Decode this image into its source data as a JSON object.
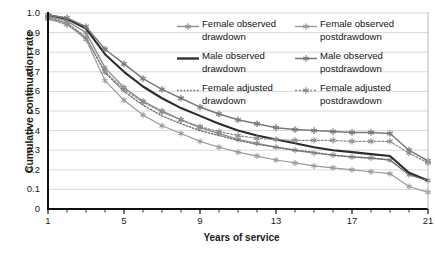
{
  "chart_data": {
    "type": "line",
    "title": "",
    "xlabel": "Years of service",
    "ylabel": "Cumulative continuation rate",
    "xlim": [
      1,
      21
    ],
    "ylim": [
      0,
      1.0
    ],
    "grid": true,
    "legend_position": "top-right",
    "x": [
      1,
      2,
      3,
      4,
      5,
      6,
      7,
      8,
      9,
      10,
      11,
      12,
      13,
      14,
      15,
      16,
      17,
      18,
      19,
      20,
      21
    ],
    "yticks": [
      "0",
      "0.1",
      "0.2",
      "0.3",
      "0.4",
      "0.5",
      "0.6",
      "0.7",
      "0.8",
      "0.9",
      "1.0"
    ],
    "xticks": [
      "1",
      "5",
      "9",
      "13",
      "17",
      "21"
    ],
    "series": [
      {
        "name": "Female observed drawdown",
        "color": "#8f8f8f",
        "style": "solid-marker",
        "values": [
          0.98,
          0.96,
          0.9,
          0.72,
          0.62,
          0.55,
          0.5,
          0.455,
          0.415,
          0.385,
          0.355,
          0.335,
          0.315,
          0.3,
          0.285,
          0.275,
          0.265,
          0.26,
          0.25,
          0.175,
          0.145
        ]
      },
      {
        "name": "Male observed drawdown",
        "color": "#2b2b2b",
        "style": "solid-thick",
        "values": [
          0.99,
          0.97,
          0.92,
          0.79,
          0.7,
          0.625,
          0.565,
          0.515,
          0.475,
          0.435,
          0.4,
          0.375,
          0.355,
          0.335,
          0.315,
          0.3,
          0.29,
          0.28,
          0.27,
          0.185,
          0.145
        ]
      },
      {
        "name": "Female adjusted drawdown",
        "color": "#6e6e6e",
        "style": "dotted",
        "values": [
          0.975,
          0.95,
          0.875,
          0.695,
          0.6,
          0.53,
          0.475,
          0.435,
          0.4,
          0.375,
          0.35,
          0.33,
          0.315,
          0.3,
          0.29,
          0.275,
          0.265,
          0.26,
          0.25,
          0.175,
          0.145
        ]
      },
      {
        "name": "Female observed postdrawdown",
        "color": "#9a9a9a",
        "style": "solid-marker-light",
        "values": [
          0.975,
          0.945,
          0.865,
          0.655,
          0.555,
          0.48,
          0.425,
          0.385,
          0.345,
          0.315,
          0.29,
          0.27,
          0.25,
          0.235,
          0.22,
          0.21,
          0.2,
          0.19,
          0.18,
          0.115,
          0.085
        ]
      },
      {
        "name": "Male observed postdrawdown",
        "color": "#7a7a7a",
        "style": "solid-marker-dark",
        "values": [
          0.99,
          0.975,
          0.93,
          0.815,
          0.74,
          0.665,
          0.61,
          0.565,
          0.52,
          0.485,
          0.455,
          0.435,
          0.415,
          0.405,
          0.4,
          0.395,
          0.39,
          0.39,
          0.385,
          0.3,
          0.245
        ]
      },
      {
        "name": "Female adjusted postdrawdown",
        "color": "#8a8a8a",
        "style": "dotted-marker",
        "values": [
          0.97,
          0.94,
          0.875,
          0.7,
          0.61,
          0.545,
          0.495,
          0.455,
          0.42,
          0.395,
          0.375,
          0.36,
          0.355,
          0.35,
          0.35,
          0.35,
          0.345,
          0.345,
          0.345,
          0.285,
          0.235
        ]
      }
    ]
  },
  "legend": {
    "entries": [
      {
        "line1": "Female observed",
        "line2": "drawdown"
      },
      {
        "line1": "Male observed",
        "line2": "drawdown"
      },
      {
        "line1": "Female adjusted",
        "line2": "drawdown"
      },
      {
        "line1": "Female observed",
        "line2": "postdrawdown"
      },
      {
        "line1": "Male observed",
        "line2": "postdrawdown"
      },
      {
        "line1": "Female adjusted",
        "line2": "postdrawdown"
      }
    ]
  },
  "axes": {
    "y_title": "Cumulative continuation rate",
    "x_title": "Years of service"
  }
}
